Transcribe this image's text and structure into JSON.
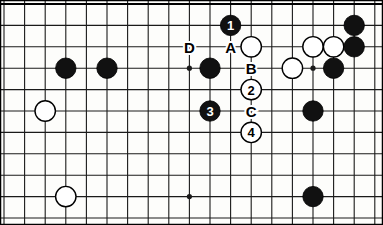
{
  "diagram": {
    "type": "go-board-diagram",
    "board": {
      "origin_x": 4,
      "origin_y": 4,
      "cell_w": 20.6,
      "cell_h": 21.4,
      "cols": 19,
      "rows": 11,
      "line_color": "#1a1a1a",
      "background_color": "#fdfdfb",
      "border_color": "#000000"
    },
    "colors": {
      "black_stone": "#111111",
      "white_stone": "#ffffff",
      "stone_outline": "#000000",
      "label_text": "#000000",
      "numbered_black_text": "#ffffff",
      "numbered_white_text": "#000000"
    },
    "star_points": [
      {
        "col": 9,
        "row": 3
      },
      {
        "col": 15,
        "row": 3
      },
      {
        "col": 9,
        "row": 9
      }
    ],
    "stones": [
      {
        "id": "b-left-1",
        "color": "black",
        "col": 3,
        "row": 3,
        "label": ""
      },
      {
        "id": "b-left-2",
        "color": "black",
        "col": 5,
        "row": 3,
        "label": ""
      },
      {
        "id": "w-left-1",
        "color": "white",
        "col": 2,
        "row": 5,
        "label": ""
      },
      {
        "id": "w-left-2",
        "color": "white",
        "col": 3,
        "row": 9,
        "label": ""
      },
      {
        "id": "b-center",
        "color": "black",
        "col": 10,
        "row": 3,
        "label": ""
      },
      {
        "id": "w-top-a",
        "color": "white",
        "col": 12,
        "row": 2,
        "label": ""
      },
      {
        "id": "w-right-1",
        "color": "white",
        "col": 14,
        "row": 3,
        "label": ""
      },
      {
        "id": "w-right-2",
        "color": "white",
        "col": 15,
        "row": 2,
        "label": ""
      },
      {
        "id": "w-right-3",
        "color": "white",
        "col": 16,
        "row": 2,
        "label": ""
      },
      {
        "id": "b-right-1",
        "color": "black",
        "col": 17,
        "row": 1,
        "label": ""
      },
      {
        "id": "b-right-2",
        "color": "black",
        "col": 17,
        "row": 2,
        "label": ""
      },
      {
        "id": "b-right-3",
        "color": "black",
        "col": 16,
        "row": 3,
        "label": ""
      },
      {
        "id": "b-right-4",
        "color": "black",
        "col": 15,
        "row": 5,
        "label": ""
      },
      {
        "id": "b-right-5",
        "color": "black",
        "col": 15,
        "row": 9,
        "label": ""
      },
      {
        "id": "move-1",
        "color": "black",
        "col": 11,
        "row": 1,
        "label": "1"
      },
      {
        "id": "move-3",
        "color": "black",
        "col": 10,
        "row": 5,
        "label": "3"
      },
      {
        "id": "move-2",
        "color": "white",
        "col": 12,
        "row": 4,
        "label": "2"
      },
      {
        "id": "move-4",
        "color": "white",
        "col": 12,
        "row": 6,
        "label": "4"
      }
    ],
    "point_labels": [
      {
        "id": "label-d",
        "text": "D",
        "col": 9,
        "row": 2
      },
      {
        "id": "label-a",
        "text": "A",
        "col": 11,
        "row": 2
      },
      {
        "id": "label-b",
        "text": "B",
        "col": 12,
        "row": 3
      },
      {
        "id": "label-c",
        "text": "C",
        "col": 12,
        "row": 5
      }
    ],
    "move_sequence": [
      "1",
      "2",
      "3",
      "4"
    ],
    "reference_letters": [
      "A",
      "B",
      "C",
      "D"
    ]
  }
}
